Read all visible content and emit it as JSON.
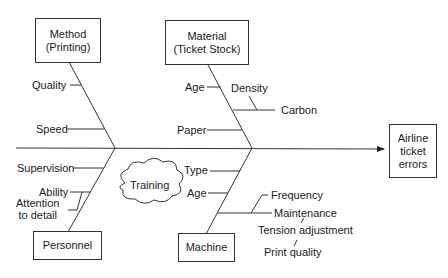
{
  "effect": "Airline\nticket\nerrors",
  "categories": {
    "method": "Method\n(Printing)",
    "material": "Material\n(Ticket Stock)",
    "personnel": "Personnel",
    "machine": "Machine"
  },
  "causes": {
    "method": [
      "Quality",
      "Speed"
    ],
    "material": [
      "Age",
      "Density",
      "Carbon",
      "Paper"
    ],
    "personnel": [
      "Supervision",
      "Ability",
      "Attention\nto detail"
    ],
    "machine": [
      "Type",
      "Age",
      "Frequency",
      "Maintenance",
      "Tension adjustment",
      "Print quality"
    ]
  },
  "floating": {
    "training": "Training"
  }
}
